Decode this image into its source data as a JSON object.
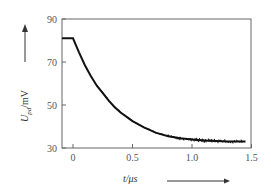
{
  "chart_data": {
    "type": "line",
    "title": "",
    "xlabel": "t/μs",
    "ylabel": "U_pd/mV",
    "xlim": [
      -0.1,
      1.5
    ],
    "ylim": [
      30,
      90
    ],
    "xticks": [
      "0",
      "0.5",
      "1.0",
      "1.5"
    ],
    "yticks": [
      "30",
      "50",
      "70",
      "90"
    ],
    "grid": false,
    "legend": null,
    "series": [
      {
        "name": "U_pd",
        "x": [
          -0.1,
          0.0,
          0.05,
          0.1,
          0.15,
          0.2,
          0.25,
          0.3,
          0.35,
          0.4,
          0.5,
          0.6,
          0.7,
          0.8,
          0.9,
          1.0,
          1.1,
          1.2,
          1.3,
          1.45
        ],
        "values": [
          81,
          81,
          74.5,
          68.5,
          63.5,
          59,
          55.5,
          52,
          49,
          46.5,
          42.5,
          39.5,
          37,
          35.5,
          34.5,
          34,
          33.5,
          33.3,
          33,
          33
        ]
      }
    ]
  },
  "labels": {
    "x_axis": "t/μs",
    "y_axis_main": "U",
    "y_axis_sub": "pd",
    "y_axis_unit": "/mV"
  }
}
